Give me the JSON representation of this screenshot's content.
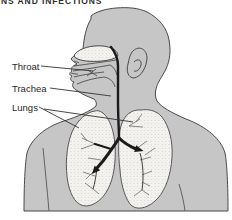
{
  "page": {
    "heading_fragment": "NS AND INFECTIONS"
  },
  "diagram": {
    "labels": {
      "throat": "Throat",
      "trachea": "Trachea",
      "lungs": "Lungs"
    },
    "colors": {
      "background": "#ffffff",
      "body": "#c6c6c6",
      "outline": "#4a4a4a",
      "cutaway": "#f6f5f2",
      "airway": "#1a1a1a",
      "label_text": "#282828",
      "heading_text": "#2e2e2e"
    }
  }
}
